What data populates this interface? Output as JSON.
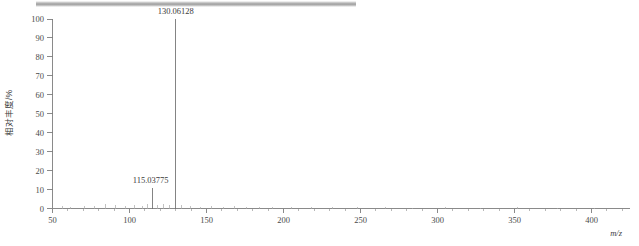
{
  "chart_data": {
    "type": "bar",
    "title": "",
    "xlabel": "m/z",
    "ylabel": "相对丰度/%",
    "xlim": [
      50,
      425
    ],
    "ylim": [
      0,
      100
    ],
    "grid": false,
    "legend": "none",
    "x_ticks": [
      50,
      100,
      150,
      200,
      250,
      300,
      350,
      400
    ],
    "x_tick_labels": [
      "50",
      "100",
      "150",
      "200",
      "250",
      "300",
      "350",
      "400"
    ],
    "x_minor_tick_step": 10,
    "y_ticks": [
      0,
      10,
      20,
      30,
      40,
      50,
      60,
      70,
      80,
      90,
      100
    ],
    "y_tick_labels": [
      "0",
      "10",
      "20",
      "30",
      "40",
      "50",
      "60",
      "70",
      "80",
      "90",
      "100"
    ],
    "annotations": [
      {
        "text": "130.06128",
        "x": 130.06128,
        "y": 100
      },
      {
        "text": "115.03775",
        "x": 115.03775,
        "y": 11
      }
    ],
    "series": [
      {
        "name": "relative abundance",
        "points": [
          {
            "x": 130.06128,
            "y": 100
          },
          {
            "x": 115.03775,
            "y": 11
          },
          {
            "x": 56.5,
            "y": 1.2
          },
          {
            "x": 62.0,
            "y": 0.9
          },
          {
            "x": 70.5,
            "y": 1.4
          },
          {
            "x": 77.0,
            "y": 1.1
          },
          {
            "x": 84.5,
            "y": 2.6
          },
          {
            "x": 91.0,
            "y": 1.8
          },
          {
            "x": 97.5,
            "y": 1.3
          },
          {
            "x": 103.0,
            "y": 2.0
          },
          {
            "x": 108.5,
            "y": 1.5
          },
          {
            "x": 112.0,
            "y": 2.2
          },
          {
            "x": 118.5,
            "y": 1.6
          },
          {
            "x": 122.0,
            "y": 2.4
          },
          {
            "x": 126.0,
            "y": 1.7
          },
          {
            "x": 134.0,
            "y": 2.1
          },
          {
            "x": 139.5,
            "y": 1.4
          },
          {
            "x": 146.0,
            "y": 1.0
          },
          {
            "x": 153.5,
            "y": 1.2
          },
          {
            "x": 161.0,
            "y": 0.9
          },
          {
            "x": 168.5,
            "y": 1.3
          },
          {
            "x": 176.0,
            "y": 0.8
          },
          {
            "x": 184.5,
            "y": 1.0
          },
          {
            "x": 193.0,
            "y": 0.7
          },
          {
            "x": 205.0,
            "y": 0.9
          },
          {
            "x": 218.0,
            "y": 0.6
          },
          {
            "x": 232.0,
            "y": 0.8
          },
          {
            "x": 248.0,
            "y": 0.6
          },
          {
            "x": 266.0,
            "y": 0.7
          },
          {
            "x": 284.0,
            "y": 0.5
          },
          {
            "x": 305.0,
            "y": 0.6
          },
          {
            "x": 328.0,
            "y": 0.5
          },
          {
            "x": 352.0,
            "y": 0.6
          },
          {
            "x": 378.0,
            "y": 0.5
          },
          {
            "x": 402.0,
            "y": 0.5
          }
        ]
      }
    ]
  },
  "chart": {
    "y_axis_label": "相对丰度/%",
    "x_axis_label": "m/z",
    "peak_label_main": "130.06128",
    "peak_label_secondary": "115.03775",
    "y_tick_labels": [
      "100",
      "90",
      "80",
      "70",
      "60",
      "50",
      "40",
      "30",
      "20",
      "10",
      "0"
    ],
    "x_tick_labels": [
      "50",
      "100",
      "150",
      "200",
      "250",
      "300",
      "350",
      "400"
    ]
  },
  "colors": {
    "axis": "#7d7d7d",
    "peak": "#6f6f6f",
    "text": "#3c3c3c",
    "top_bar": "#9d9d9d"
  }
}
